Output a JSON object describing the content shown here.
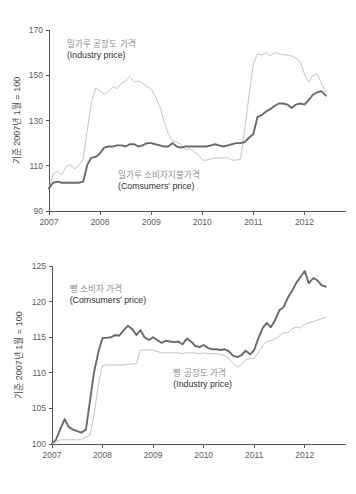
{
  "chart_data": [
    {
      "id": "wheat-flour-price-index",
      "type": "line",
      "title": "",
      "xlabel": "",
      "ylabel": "기준 2007년 1월 = 100",
      "ylim": [
        90,
        170
      ],
      "yticks": [
        90,
        110,
        130,
        150,
        170
      ],
      "xlim": [
        2007.0,
        2012.5
      ],
      "xticks": [
        2007,
        2008,
        2009,
        2010,
        2011,
        2012
      ],
      "xtick_labels": [
        "2007",
        "2008",
        "2009",
        "2010",
        "2011",
        "2012"
      ],
      "grid": false,
      "legend_position": "inline-annotation",
      "annotations": [
        {
          "name": "industry-price-label",
          "ko": "밀가루 공장도 가격",
          "en": "(Industry price)",
          "x": 2007.35,
          "y": 162.5
        },
        {
          "name": "consumers-price-label",
          "ko": "밀가루 소비자지불가격",
          "en": "(Comsumers' price)",
          "x": 2008.35,
          "y": 104.5
        }
      ],
      "series": [
        {
          "name": "밀가루 공장도 가격 (Industry price)",
          "style": "light",
          "color": "#bcbcbc",
          "x": [
            2007.0,
            2007.08,
            2007.17,
            2007.25,
            2007.33,
            2007.42,
            2007.5,
            2007.58,
            2007.67,
            2007.75,
            2007.83,
            2007.92,
            2008.0,
            2008.08,
            2008.17,
            2008.25,
            2008.33,
            2008.42,
            2008.5,
            2008.58,
            2008.67,
            2008.75,
            2008.83,
            2008.92,
            2009.0,
            2009.08,
            2009.17,
            2009.25,
            2009.33,
            2009.42,
            2009.5,
            2009.58,
            2009.67,
            2009.75,
            2009.83,
            2009.92,
            2010.0,
            2010.08,
            2010.17,
            2010.25,
            2010.33,
            2010.42,
            2010.5,
            2010.58,
            2010.67,
            2010.75,
            2010.83,
            2010.92,
            2011.0,
            2011.08,
            2011.17,
            2011.25,
            2011.33,
            2011.42,
            2011.5,
            2011.58,
            2011.67,
            2011.75,
            2011.83,
            2011.92,
            2012.0,
            2012.08,
            2012.17,
            2012.25,
            2012.33,
            2012.42
          ],
          "values": [
            100.0,
            106.5,
            107.5,
            106.0,
            109.5,
            110.5,
            108.5,
            110.0,
            113.0,
            126.0,
            138.0,
            144.5,
            143.0,
            141.5,
            143.0,
            145.0,
            144.0,
            146.5,
            147.5,
            149.5,
            147.0,
            147.5,
            146.5,
            145.0,
            144.0,
            141.0,
            136.0,
            130.0,
            124.5,
            121.0,
            120.5,
            119.5,
            117.0,
            117.5,
            116.5,
            115.0,
            112.5,
            112.5,
            113.0,
            113.5,
            113.5,
            113.5,
            113.5,
            112.5,
            112.5,
            113.0,
            126.0,
            142.0,
            155.0,
            159.5,
            159.0,
            160.0,
            158.5,
            160.0,
            159.5,
            159.0,
            159.0,
            158.5,
            157.5,
            156.0,
            150.5,
            147.0,
            150.0,
            150.5,
            146.5,
            142.5
          ]
        },
        {
          "name": "밀가루 소비자지불가격 (Comsumers' price)",
          "style": "dark",
          "color": "#6a6a6a",
          "x": [
            2007.0,
            2007.08,
            2007.17,
            2007.25,
            2007.33,
            2007.42,
            2007.5,
            2007.58,
            2007.67,
            2007.75,
            2007.83,
            2007.92,
            2008.0,
            2008.08,
            2008.17,
            2008.25,
            2008.33,
            2008.42,
            2008.5,
            2008.58,
            2008.67,
            2008.75,
            2008.83,
            2008.92,
            2009.0,
            2009.08,
            2009.17,
            2009.25,
            2009.33,
            2009.42,
            2009.5,
            2009.58,
            2009.67,
            2009.75,
            2009.83,
            2009.92,
            2010.0,
            2010.08,
            2010.17,
            2010.25,
            2010.33,
            2010.42,
            2010.5,
            2010.58,
            2010.67,
            2010.75,
            2010.83,
            2010.92,
            2011.0,
            2011.08,
            2011.17,
            2011.25,
            2011.33,
            2011.42,
            2011.5,
            2011.58,
            2011.67,
            2011.75,
            2011.83,
            2011.92,
            2012.0,
            2012.08,
            2012.17,
            2012.25,
            2012.33,
            2012.42
          ],
          "values": [
            100.0,
            102.5,
            103.0,
            102.5,
            102.5,
            102.5,
            102.5,
            102.5,
            103.0,
            110.5,
            113.5,
            114.0,
            115.5,
            118.0,
            118.5,
            118.5,
            119.0,
            119.0,
            118.5,
            119.5,
            119.5,
            118.5,
            119.0,
            120.0,
            120.0,
            119.5,
            119.0,
            118.5,
            118.5,
            120.0,
            118.5,
            118.0,
            118.5,
            118.5,
            118.5,
            118.5,
            118.5,
            118.5,
            119.0,
            119.5,
            119.0,
            118.5,
            119.0,
            119.5,
            120.0,
            120.0,
            120.5,
            122.5,
            124.0,
            131.5,
            132.5,
            134.0,
            135.0,
            136.5,
            137.5,
            137.5,
            137.0,
            135.5,
            137.0,
            137.5,
            137.0,
            139.0,
            141.5,
            142.5,
            143.0,
            141.0
          ]
        }
      ]
    },
    {
      "id": "bread-price-index",
      "type": "line",
      "title": "",
      "xlabel": "",
      "ylabel": "기준 2007년 1월 = 100",
      "ylim": [
        100,
        125
      ],
      "yticks": [
        100,
        105,
        110,
        115,
        120,
        125
      ],
      "xlim": [
        2007.0,
        2012.5
      ],
      "xticks": [
        2007,
        2008,
        2009,
        2010,
        2011,
        2012
      ],
      "xtick_labels": [
        "2007",
        "2008",
        "2009",
        "2010",
        "2011",
        "2012"
      ],
      "grid": false,
      "legend_position": "inline-annotation",
      "annotations": [
        {
          "name": "consumers-price-label",
          "ko": "빵 소비자 가격",
          "en": "(Comsumers' price)",
          "x": 2007.35,
          "y": 121.3
        },
        {
          "name": "industry-price-label",
          "ko": "빵 공장도 가격",
          "en": "(Industry price)",
          "x": 2009.4,
          "y": 109.6
        }
      ],
      "series": [
        {
          "name": "빵 소비자 가격 (Comsumers' price)",
          "style": "dark",
          "color": "#6a6a6a",
          "x": [
            2007.0,
            2007.08,
            2007.17,
            2007.25,
            2007.33,
            2007.42,
            2007.5,
            2007.58,
            2007.67,
            2007.75,
            2007.83,
            2007.92,
            2008.0,
            2008.08,
            2008.17,
            2008.25,
            2008.33,
            2008.42,
            2008.5,
            2008.58,
            2008.67,
            2008.75,
            2008.83,
            2008.92,
            2009.0,
            2009.08,
            2009.17,
            2009.25,
            2009.33,
            2009.42,
            2009.5,
            2009.58,
            2009.67,
            2009.75,
            2009.83,
            2009.92,
            2010.0,
            2010.08,
            2010.17,
            2010.25,
            2010.33,
            2010.42,
            2010.5,
            2010.58,
            2010.67,
            2010.75,
            2010.83,
            2010.92,
            2011.0,
            2011.08,
            2011.17,
            2011.25,
            2011.33,
            2011.42,
            2011.5,
            2011.58,
            2011.67,
            2011.75,
            2011.83,
            2011.92,
            2012.0,
            2012.08,
            2012.17,
            2012.25,
            2012.33,
            2012.42
          ],
          "values": [
            100.0,
            100.6,
            102.2,
            103.5,
            102.4,
            102.0,
            101.8,
            101.6,
            102.0,
            106.0,
            110.0,
            113.0,
            114.9,
            114.9,
            115.0,
            115.3,
            115.2,
            116.0,
            116.6,
            116.2,
            115.3,
            116.0,
            115.0,
            114.6,
            115.0,
            114.6,
            114.2,
            114.5,
            114.4,
            114.3,
            114.4,
            114.0,
            114.8,
            114.4,
            113.8,
            113.6,
            113.9,
            113.5,
            113.3,
            113.3,
            113.2,
            113.3,
            113.0,
            112.4,
            112.2,
            112.5,
            113.1,
            112.6,
            113.2,
            114.8,
            116.3,
            117.0,
            116.4,
            117.5,
            118.8,
            119.2,
            120.6,
            121.5,
            122.6,
            123.5,
            124.3,
            122.6,
            123.3,
            123.0,
            122.3,
            122.1
          ]
        },
        {
          "name": "빵 공장도 가격 (Industry price)",
          "style": "light",
          "color": "#bcbcbc",
          "x": [
            2007.0,
            2007.08,
            2007.17,
            2007.25,
            2007.33,
            2007.42,
            2007.5,
            2007.58,
            2007.67,
            2007.75,
            2007.83,
            2007.92,
            2008.0,
            2008.08,
            2008.17,
            2008.25,
            2008.33,
            2008.42,
            2008.5,
            2008.58,
            2008.67,
            2008.75,
            2008.83,
            2008.92,
            2009.0,
            2009.08,
            2009.17,
            2009.25,
            2009.33,
            2009.42,
            2009.5,
            2009.58,
            2009.67,
            2009.75,
            2009.83,
            2009.92,
            2010.0,
            2010.08,
            2010.17,
            2010.25,
            2010.33,
            2010.42,
            2010.5,
            2010.58,
            2010.67,
            2010.75,
            2010.83,
            2010.92,
            2011.0,
            2011.08,
            2011.17,
            2011.25,
            2011.33,
            2011.42,
            2011.5,
            2011.58,
            2011.67,
            2011.75,
            2011.83,
            2011.92,
            2012.0,
            2012.08,
            2012.17,
            2012.25,
            2012.33,
            2012.42
          ],
          "values": [
            100.0,
            100.3,
            100.6,
            100.6,
            100.6,
            100.6,
            100.6,
            100.6,
            101.0,
            101.2,
            104.0,
            108.5,
            111.0,
            111.1,
            111.1,
            111.1,
            111.1,
            111.1,
            111.2,
            111.2,
            111.3,
            113.2,
            113.2,
            113.2,
            113.2,
            113.0,
            112.8,
            112.8,
            112.8,
            112.8,
            112.8,
            112.7,
            112.8,
            112.8,
            112.8,
            112.7,
            112.8,
            112.7,
            112.7,
            112.7,
            112.6,
            112.4,
            112.0,
            111.4,
            110.8,
            111.2,
            111.8,
            112.0,
            112.0,
            112.8,
            113.8,
            114.4,
            114.5,
            114.8,
            115.2,
            115.6,
            115.6,
            116.2,
            116.4,
            116.3,
            116.8,
            117.0,
            117.2,
            117.4,
            117.6,
            117.8
          ]
        }
      ]
    }
  ],
  "figures": {
    "top": {
      "name": "wheat-flour-chart",
      "ylabel": "기준 2007년 1월 = 100"
    },
    "bottom": {
      "name": "bread-chart",
      "ylabel": "기준 2007년 1월 = 100"
    }
  }
}
